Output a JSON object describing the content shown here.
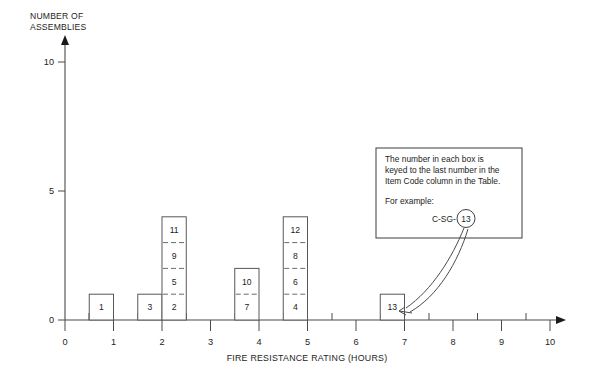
{
  "chart_data": {
    "type": "bar",
    "title": "",
    "xlabel": "FIRE RESISTANCE RATING (HOURS)",
    "ylabel": "NUMBER OF ASSEMBLIES",
    "ylabel_line1": "NUMBER OF",
    "ylabel_line2": "ASSEMBLIES",
    "xlim": [
      0,
      10
    ],
    "ylim": [
      0,
      10
    ],
    "x_ticks": [
      0,
      1,
      2,
      3,
      4,
      5,
      6,
      7,
      8,
      9,
      10
    ],
    "x_tick_labels": [
      "0",
      "1",
      "2",
      "3",
      "4",
      "5",
      "6",
      "7",
      "8",
      "9",
      "10"
    ],
    "x_minor_tick_step": 0.5,
    "y_ticks": [
      0,
      5,
      10
    ],
    "y_tick_labels": [
      "0",
      "5",
      "10"
    ],
    "grid": false,
    "legend": "none",
    "stacked": true,
    "bar_width_hours": 0.5,
    "bars": [
      {
        "x_start": 0.5,
        "x_end": 1.0,
        "height": 1,
        "segments": [
          "1"
        ]
      },
      {
        "x_start": 1.5,
        "x_end": 2.0,
        "height": 1,
        "segments": [
          "3"
        ]
      },
      {
        "x_start": 2.0,
        "x_end": 2.5,
        "height": 4,
        "segments": [
          "2",
          "5",
          "9",
          "11"
        ]
      },
      {
        "x_start": 3.5,
        "x_end": 4.0,
        "height": 2,
        "segments": [
          "7",
          "10"
        ]
      },
      {
        "x_start": 4.5,
        "x_end": 5.0,
        "height": 4,
        "segments": [
          "4",
          "6",
          "8",
          "12"
        ]
      },
      {
        "x_start": 6.5,
        "x_end": 7.0,
        "height": 1,
        "segments": [
          "13"
        ]
      }
    ],
    "categories": [
      "0.5-1.0",
      "1.5-2.0",
      "2.0-2.5",
      "3.5-4.0",
      "4.5-5.0",
      "6.5-7.0"
    ],
    "values": [
      1,
      1,
      4,
      2,
      4,
      1
    ],
    "item_codes_in_boxes": [
      "1",
      "3",
      "2",
      "5",
      "9",
      "11",
      "7",
      "10",
      "4",
      "6",
      "8",
      "12",
      "13"
    ],
    "annotation": {
      "line1": "The number in each box is",
      "line2": "keyed to the last number in the",
      "line3": "Item Code column in the Table.",
      "line4": "For example:",
      "example_prefix": "C-SG-",
      "example_circled": "13",
      "points_to_bar": "13"
    }
  },
  "colors": {
    "background": "#ffffff",
    "line": "#4a4a4a",
    "bar_stroke": "#585858",
    "divider": "#6b6b6b",
    "text": "#1d1d1d"
  }
}
